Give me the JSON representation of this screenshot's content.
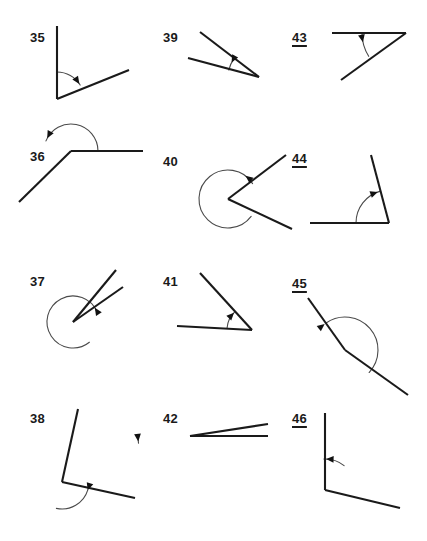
{
  "page": {
    "kind": "geometry-worksheet",
    "background_color": "#ffffff",
    "ink_color": "#1a1a1a",
    "arc_color": "#4a4a4a",
    "columns": 3,
    "rows": 4
  },
  "figures": [
    {
      "id": "fig-35",
      "number": "35",
      "underlined": false,
      "angle_type": "acute",
      "arc_style": "small-arc",
      "label_x": 30,
      "label_y": 31,
      "vertex": {
        "x": 57,
        "y": 99
      },
      "rays": [
        {
          "name": "ray-up",
          "x2": 57,
          "y2": 26
        },
        {
          "name": "ray-right-up",
          "x2": 129,
          "y2": 70
        }
      ],
      "arc": {
        "radius": 27,
        "start_deg": 90,
        "end_deg": 31,
        "sweep": "clockwise"
      },
      "arrow_at_deg": 34
    },
    {
      "id": "fig-39",
      "number": "39",
      "underlined": false,
      "angle_type": "acute",
      "arc_style": "small-arc",
      "label_x": 163,
      "label_y": 31,
      "vertex": {
        "x": 259,
        "y": 77
      },
      "rays": [
        {
          "name": "ray-upper-left",
          "x2": 200,
          "y2": 32
        },
        {
          "name": "ray-left",
          "x2": 188,
          "y2": 58
        }
      ],
      "arc": {
        "radius": 31,
        "start_deg": 143,
        "end_deg": 167,
        "sweep": "counterclockwise"
      },
      "arrow_at_deg": 152
    },
    {
      "id": "fig-43",
      "number": "43",
      "underlined": true,
      "angle_type": "acute",
      "arc_style": "small-arc",
      "label_x": 292,
      "label_y": 31,
      "vertex": {
        "x": 406,
        "y": 33
      },
      "rays": [
        {
          "name": "ray-left-horizontal",
          "x2": 332,
          "y2": 33
        },
        {
          "name": "ray-lower-left",
          "x2": 341,
          "y2": 80
        }
      ],
      "arc": {
        "radius": 44,
        "start_deg": 180,
        "end_deg": 212,
        "sweep": "counterclockwise"
      },
      "arrow_at_deg": 192
    },
    {
      "id": "fig-36",
      "number": "36",
      "underlined": false,
      "angle_type": "obtuse",
      "arc_style": "large-arc",
      "label_x": 30,
      "label_y": 150,
      "vertex": {
        "x": 71,
        "y": 151
      },
      "rays": [
        {
          "name": "ray-right-horizontal",
          "x2": 143,
          "y2": 151
        },
        {
          "name": "ray-lower-left",
          "x2": 19,
          "y2": 202
        }
      ],
      "arc": {
        "radius": 27,
        "start_deg": 0,
        "end_deg": 158,
        "sweep": "counterclockwise"
      },
      "arrow_at_deg": 152
    },
    {
      "id": "fig-40",
      "number": "40",
      "underlined": false,
      "angle_type": "reflex",
      "arc_style": "reflex-circle",
      "label_x": 163,
      "label_y": 155,
      "vertex": {
        "x": 228,
        "y": 199
      },
      "rays": [
        {
          "name": "ray-upper-right",
          "x2": 286,
          "y2": 155
        },
        {
          "name": "ray-lower-right",
          "x2": 292,
          "y2": 229
        }
      ],
      "arc": {
        "radius": 29,
        "start_deg": 32,
        "end_deg": 323,
        "sweep": "counterclockwise"
      },
      "arrow_at_deg": 53
    },
    {
      "id": "fig-44",
      "number": "44",
      "underlined": true,
      "angle_type": "acute",
      "arc_style": "quarter-arc",
      "label_x": 292,
      "label_y": 152,
      "vertex": {
        "x": 389,
        "y": 223
      },
      "rays": [
        {
          "name": "ray-left-horizontal",
          "x2": 310,
          "y2": 223
        },
        {
          "name": "ray-up",
          "x2": 371,
          "y2": 155
        }
      ],
      "arc": {
        "radius": 33,
        "start_deg": 180,
        "end_deg": 105,
        "sweep": "clockwise"
      },
      "arrow_at_deg": 110
    },
    {
      "id": "fig-37",
      "number": "37",
      "underlined": false,
      "angle_type": "reflex",
      "arc_style": "reflex-circle",
      "label_x": 30,
      "label_y": 275,
      "vertex": {
        "x": 73,
        "y": 322
      },
      "rays": [
        {
          "name": "ray-upper-right-steep",
          "x2": 116,
          "y2": 270
        },
        {
          "name": "ray-upper-right-shallow",
          "x2": 123,
          "y2": 287
        }
      ],
      "arc": {
        "radius": 26,
        "start_deg": 22,
        "end_deg": 309,
        "sweep": "counterclockwise"
      },
      "arrow_at_deg": 33
    },
    {
      "id": "fig-41",
      "number": "41",
      "underlined": false,
      "angle_type": "acute",
      "arc_style": "small-arc",
      "label_x": 163,
      "label_y": 275,
      "vertex": {
        "x": 252,
        "y": 330
      },
      "rays": [
        {
          "name": "ray-upper-left",
          "x2": 200,
          "y2": 273
        },
        {
          "name": "ray-left-horizontal",
          "x2": 177,
          "y2": 326
        }
      ],
      "arc": {
        "radius": 25,
        "start_deg": 175,
        "end_deg": 132,
        "sweep": "clockwise"
      },
      "arrow_at_deg": 136
    },
    {
      "id": "fig-45",
      "number": "45",
      "underlined": true,
      "angle_type": "obtuse",
      "arc_style": "large-arc",
      "label_x": 292,
      "label_y": 277,
      "vertex": {
        "x": 345,
        "y": 350
      },
      "rays": [
        {
          "name": "ray-upper-left",
          "x2": 308,
          "y2": 298
        },
        {
          "name": "ray-lower-right",
          "x2": 408,
          "y2": 395
        }
      ],
      "arc": {
        "radius": 33,
        "start_deg": 125,
        "end_deg": 317,
        "sweep": "clockwise"
      },
      "arrow_at_deg": 128
    },
    {
      "id": "fig-38",
      "number": "38",
      "underlined": false,
      "angle_type": "reflex",
      "arc_style": "reflex-circle",
      "label_x": 30,
      "label_y": 412,
      "vertex": {
        "x": 62,
        "y": 482
      },
      "rays": [
        {
          "name": "ray-up",
          "x2": 78,
          "y2": 409
        },
        {
          "name": "ray-lower-right",
          "x2": 135,
          "y2": 498
        }
      ],
      "arc": {
        "radius": 27,
        "start_deg": 343,
        "end_deg": 258,
        "sweep": "clockwise"
      },
      "arrow_at_deg": 342
    },
    {
      "id": "fig-42",
      "number": "42",
      "underlined": false,
      "angle_type": "acute-small",
      "arc_style": "tiny-tick",
      "label_x": 163,
      "label_y": 412,
      "vertex": {
        "x": 190,
        "y": 436
      },
      "rays": [
        {
          "name": "ray-right-horizontal",
          "x2": 268,
          "y2": 436
        },
        {
          "name": "ray-right-slight-up",
          "x2": 268,
          "y2": 424
        }
      ],
      "arc": {
        "radius": 52,
        "start_deg": 180,
        "end_deg": 188,
        "sweep": "counterclockwise"
      },
      "arrow_at_deg": 186
    },
    {
      "id": "fig-46",
      "number": "46",
      "underlined": true,
      "angle_type": "right",
      "arc_style": "quarter-arc",
      "label_x": 292,
      "label_y": 412,
      "vertex": {
        "x": 325,
        "y": 490
      },
      "rays": [
        {
          "name": "ray-up",
          "x2": 325,
          "y2": 413
        },
        {
          "name": "ray-lower-right",
          "x2": 400,
          "y2": 508
        }
      ],
      "arc": {
        "radius": 31,
        "start_deg": 52,
        "end_deg": 92,
        "sweep": "counterclockwise"
      },
      "arrow_at_deg": 88
    }
  ]
}
